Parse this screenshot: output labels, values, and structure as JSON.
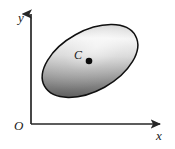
{
  "figure": {
    "background_color": "#ffffff",
    "width": 175,
    "height": 149
  },
  "axes": {
    "color": "#262626",
    "line_width": 1.6,
    "origin": {
      "x": 31,
      "y": 124
    },
    "y_axis": {
      "label": "y",
      "from": {
        "x": 31,
        "y": 124
      },
      "to": {
        "x": 31,
        "y": 12
      },
      "arrow": "up",
      "label_pos": {
        "x": 18,
        "y": 19
      }
    },
    "x_axis": {
      "label": "x",
      "from": {
        "x": 31,
        "y": 124
      },
      "to": {
        "x": 163,
        "y": 124
      },
      "arrow": "right",
      "label_pos": {
        "x": 158,
        "y": 140
      }
    },
    "origin_label": {
      "label": "O",
      "label_pos": {
        "x": 15,
        "y": 130
      }
    }
  },
  "region": {
    "shape": "ellipse",
    "center": {
      "x": 90,
      "y": 61
    },
    "radius_major": 52,
    "radius_minor": 30,
    "rotation_deg": -29,
    "outline_color": "#101010",
    "outline_width": 1.4,
    "fill_type": "gradient",
    "gradient_dark": "#4a4a4a",
    "gradient_mid": "#9e9e9e",
    "gradient_light": "#f2f2f2",
    "gradient_angle_deg": 45
  },
  "center_point": {
    "label": "C",
    "marker": "filled-dot",
    "marker_color": "#0d0d0d",
    "marker_radius": 3.2,
    "position": {
      "x": 89,
      "y": 61
    },
    "label_pos": {
      "x": 75,
      "y": 58
    }
  }
}
